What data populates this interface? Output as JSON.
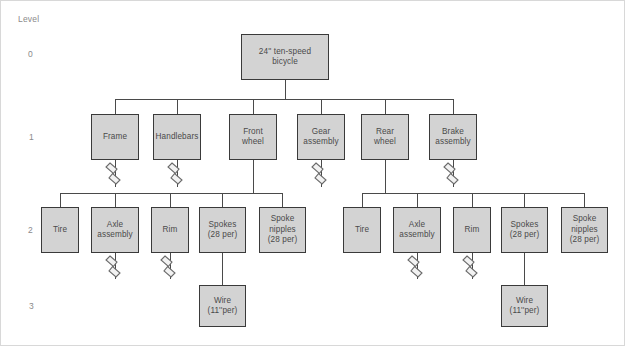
{
  "diagram": {
    "type": "product-structure-tree",
    "title_axis": "Level",
    "level_labels": [
      "0",
      "1",
      "2",
      "3"
    ],
    "colors": {
      "node_fill": "#d3d3d3",
      "node_border": "#3a3a3a",
      "connector": "#4a4a4a",
      "label_text": "#8a8a8a",
      "node_text": "#4a4a4a",
      "page_border": "#d8d8d8",
      "background": "#ffffff"
    },
    "nodes": [
      {
        "id": "root",
        "level": 0,
        "label": "24'' ten-speed\nbicycle",
        "x": 240,
        "y": 33,
        "w": 88,
        "h": 46,
        "break_symbol": false
      },
      {
        "id": "frame",
        "level": 1,
        "label": "Frame",
        "x": 90,
        "y": 113,
        "w": 48,
        "h": 46,
        "break_symbol": true
      },
      {
        "id": "handlebars",
        "level": 1,
        "label": "Handlebars",
        "x": 152,
        "y": 113,
        "w": 48,
        "h": 46,
        "break_symbol": true
      },
      {
        "id": "front-wheel",
        "level": 1,
        "label": "Front\nwheel",
        "x": 228,
        "y": 113,
        "w": 48,
        "h": 46,
        "break_symbol": false
      },
      {
        "id": "gear-assembly",
        "level": 1,
        "label": "Gear\nassembly",
        "x": 296,
        "y": 113,
        "w": 48,
        "h": 46,
        "break_symbol": true
      },
      {
        "id": "rear-wheel",
        "level": 1,
        "label": "Rear\nwheel",
        "x": 360,
        "y": 113,
        "w": 48,
        "h": 46,
        "break_symbol": false
      },
      {
        "id": "brake-assembly",
        "level": 1,
        "label": "Brake\nassembly",
        "x": 428,
        "y": 113,
        "w": 48,
        "h": 46,
        "break_symbol": true
      },
      {
        "id": "fw-tire",
        "level": 2,
        "label": "Tire",
        "x": 40,
        "y": 206,
        "w": 38,
        "h": 46,
        "break_symbol": false
      },
      {
        "id": "fw-axle",
        "level": 2,
        "label": "Axle\nassembly",
        "x": 90,
        "y": 206,
        "w": 48,
        "h": 46,
        "break_symbol": true
      },
      {
        "id": "fw-rim",
        "level": 2,
        "label": "Rim",
        "x": 150,
        "y": 206,
        "w": 38,
        "h": 46,
        "break_symbol": true
      },
      {
        "id": "fw-spokes",
        "level": 2,
        "label": "Spokes\n(28 per)",
        "x": 198,
        "y": 206,
        "w": 47,
        "h": 46,
        "break_symbol": false
      },
      {
        "id": "fw-nipples",
        "level": 2,
        "label": "Spoke\nnipples\n(28 per)",
        "x": 258,
        "y": 206,
        "w": 47,
        "h": 46,
        "break_symbol": false
      },
      {
        "id": "rw-tire",
        "level": 2,
        "label": "Tire",
        "x": 342,
        "y": 206,
        "w": 38,
        "h": 46,
        "break_symbol": false
      },
      {
        "id": "rw-axle",
        "level": 2,
        "label": "Axle\nassembly",
        "x": 392,
        "y": 206,
        "w": 48,
        "h": 46,
        "break_symbol": true
      },
      {
        "id": "rw-rim",
        "level": 2,
        "label": "Rim",
        "x": 452,
        "y": 206,
        "w": 38,
        "h": 46,
        "break_symbol": true
      },
      {
        "id": "rw-spokes",
        "level": 2,
        "label": "Spokes\n(28 per)",
        "x": 500,
        "y": 206,
        "w": 47,
        "h": 46,
        "break_symbol": false
      },
      {
        "id": "rw-nipples",
        "level": 2,
        "label": "Spoke\nnipples\n(28 per)",
        "x": 560,
        "y": 206,
        "w": 47,
        "h": 46,
        "break_symbol": false
      },
      {
        "id": "fw-wire",
        "level": 3,
        "label": "Wire\n(11''per)",
        "x": 198,
        "y": 284,
        "w": 47,
        "h": 42,
        "break_symbol": false
      },
      {
        "id": "rw-wire",
        "level": 3,
        "label": "Wire\n(11''per)",
        "x": 500,
        "y": 284,
        "w": 47,
        "h": 42,
        "break_symbol": false
      }
    ],
    "edges": [
      {
        "from": "root",
        "to": [
          "frame",
          "handlebars",
          "front-wheel",
          "gear-assembly",
          "rear-wheel",
          "brake-assembly"
        ]
      },
      {
        "from": "front-wheel",
        "to": [
          "fw-tire",
          "fw-axle",
          "fw-rim",
          "fw-spokes",
          "fw-nipples"
        ]
      },
      {
        "from": "rear-wheel",
        "to": [
          "rw-tire",
          "rw-axle",
          "rw-rim",
          "rw-spokes",
          "rw-nipples"
        ]
      },
      {
        "from": "fw-spokes",
        "to": [
          "fw-wire"
        ]
      },
      {
        "from": "rw-spokes",
        "to": [
          "rw-wire"
        ]
      }
    ]
  }
}
